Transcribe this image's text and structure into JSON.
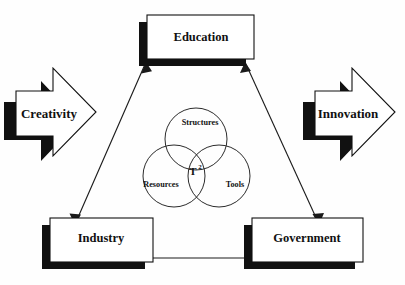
{
  "diagram": {
    "background_color": "#fefefe",
    "ink_color": "#111111",
    "nodes": [
      {
        "id": "education",
        "label": "Education",
        "shape": "3d-box"
      },
      {
        "id": "industry",
        "label": "Industry",
        "shape": "3d-box"
      },
      {
        "id": "government",
        "label": "Government",
        "shape": "3d-box"
      }
    ],
    "input_arrow": {
      "label": "Creativity",
      "direction": "right",
      "shape": "block-arrow-3d"
    },
    "output_arrow": {
      "label": "Innovation",
      "direction": "right",
      "shape": "block-arrow-3d"
    },
    "venn": {
      "center_label": "T",
      "center_superscript": "2",
      "circles": [
        {
          "id": "structures",
          "label": "Structures",
          "position": "top"
        },
        {
          "id": "resources",
          "label": "Resources",
          "position": "bottom-left"
        },
        {
          "id": "tools",
          "label": "Tools",
          "position": "bottom-right"
        }
      ]
    },
    "connectors": [
      {
        "id": "education-industry",
        "from": "Education",
        "to": "Industry",
        "style": "double-headed"
      },
      {
        "id": "education-government",
        "from": "Education",
        "to": "Government",
        "style": "double-headed"
      },
      {
        "id": "industry-government",
        "from": "Industry",
        "to": "Government",
        "style": "double-headed"
      }
    ]
  }
}
